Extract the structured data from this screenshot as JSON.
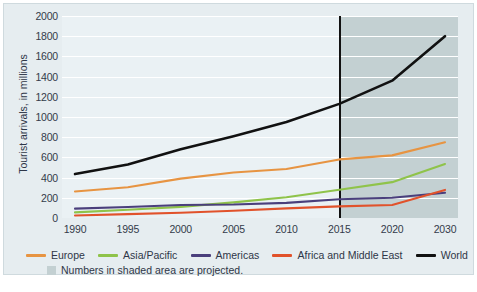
{
  "chart_data": {
    "type": "line",
    "title": "",
    "xlabel": "",
    "ylabel": "Tourist arrivals, in millions",
    "categories": [
      "1990",
      "1995",
      "2000",
      "2005",
      "2010",
      "2015",
      "2020",
      "2030"
    ],
    "ylim": [
      0,
      2000
    ],
    "yticks": [
      "0",
      "200",
      "400",
      "600",
      "800",
      "1000",
      "1200",
      "1400",
      "1600",
      "1800",
      "2000"
    ],
    "grid": true,
    "legend_position": "bottom",
    "projection_start_category": "2015",
    "projection_note": "Numbers in shaded area are projected.",
    "series": [
      {
        "name": "Europe",
        "color": "#E79442",
        "values": [
          262,
          305,
          390,
          450,
          485,
          580,
          620,
          750
        ]
      },
      {
        "name": "Asia/Pacific",
        "color": "#8FC34A",
        "values": [
          56,
          82,
          110,
          155,
          205,
          280,
          355,
          535
        ]
      },
      {
        "name": "Americas",
        "color": "#4A3F7C",
        "values": [
          93,
          109,
          128,
          133,
          150,
          185,
          200,
          250
        ]
      },
      {
        "name": "Africa and Middle East",
        "color": "#E1522B",
        "values": [
          25,
          38,
          52,
          72,
          95,
          115,
          128,
          278
        ]
      },
      {
        "name": "World",
        "color": "#111111",
        "values": [
          435,
          530,
          680,
          810,
          950,
          1130,
          1360,
          1800
        ]
      }
    ]
  },
  "legend": {
    "items": [
      {
        "label": "Europe",
        "color": "#E79442",
        "icon": "line-swatch-icon"
      },
      {
        "label": "Asia/Pacific",
        "color": "#8FC34A",
        "icon": "line-swatch-icon"
      },
      {
        "label": "Americas",
        "color": "#4A3F7C",
        "icon": "line-swatch-icon"
      },
      {
        "label": "Africa and Middle East",
        "color": "#E1522B",
        "icon": "line-swatch-icon"
      },
      {
        "label": "World",
        "color": "#111111",
        "icon": "line-swatch-icon"
      }
    ]
  },
  "note": {
    "text": "Numbers in shaded area are projected.",
    "swatch_color": "#c3d0d2"
  },
  "caption": {
    "text": ""
  },
  "colors": {
    "panel_background": "#e6edf0",
    "plot_background": "#eaf1f4",
    "shaded_background": "#c3d0d2",
    "gridline": "#ffffff",
    "divider": "#111111",
    "tick_text": "#333b4a"
  }
}
